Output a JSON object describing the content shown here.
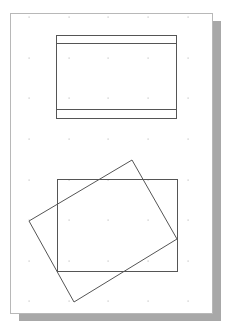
{
  "drawing": {
    "sheet": {
      "x": 10,
      "y": 13,
      "width": 202,
      "height": 300,
      "border_color": "#b8b8b8",
      "fill": "#ffffff"
    },
    "shadow": {
      "offset_x": 9,
      "offset_y": 8,
      "color": "#a8a8a8"
    },
    "grid": {
      "dot_color": "#c4c4c4",
      "xs": [
        29,
        69,
        108,
        148,
        188
      ],
      "ys": [
        17,
        58,
        98,
        139,
        180,
        220,
        261,
        301
      ]
    },
    "stroke_color": "#555555",
    "shapes": [
      {
        "name": "top-rectangle",
        "type": "rect",
        "x": 56,
        "y": 35,
        "width": 120,
        "height": 83
      },
      {
        "name": "top-rectangle-upper-band-line",
        "type": "line",
        "x1": 56,
        "y1": 43,
        "x2": 176,
        "y2": 43
      },
      {
        "name": "top-rectangle-lower-band-line",
        "type": "line",
        "x1": 56,
        "y1": 109,
        "x2": 176,
        "y2": 109
      },
      {
        "name": "bottom-rectangle",
        "type": "rect",
        "x": 57,
        "y": 179,
        "width": 120,
        "height": 92
      },
      {
        "name": "rotated-rectangle",
        "type": "polygon",
        "points": "132,160 177,239 74,302 29,221"
      }
    ]
  }
}
